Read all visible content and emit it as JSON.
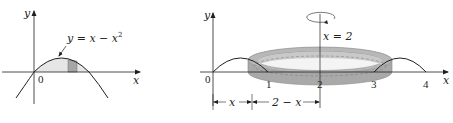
{
  "left_figure": {
    "axis_x_label": "x",
    "axis_y_label": "y",
    "origin_label": "0",
    "curve_label": "y = x − x",
    "curve_label_exponent": "2",
    "colors": {
      "region_fill": "#e6e6e6",
      "strip_fill": "#a6a6a6",
      "curve": "#231f20"
    }
  },
  "right_figure": {
    "axis_x_label": "x",
    "axis_y_label": "y",
    "tick_labels": [
      "0",
      "1",
      "2",
      "3",
      "4"
    ],
    "axis_of_rotation_label": "x = 2",
    "dimension_labels": {
      "left": "x",
      "right": "2 − x"
    },
    "colors": {
      "ring_fill": "#b3b3b3",
      "ring_dark": "#9a9a9a",
      "curve": "#231f20"
    }
  }
}
